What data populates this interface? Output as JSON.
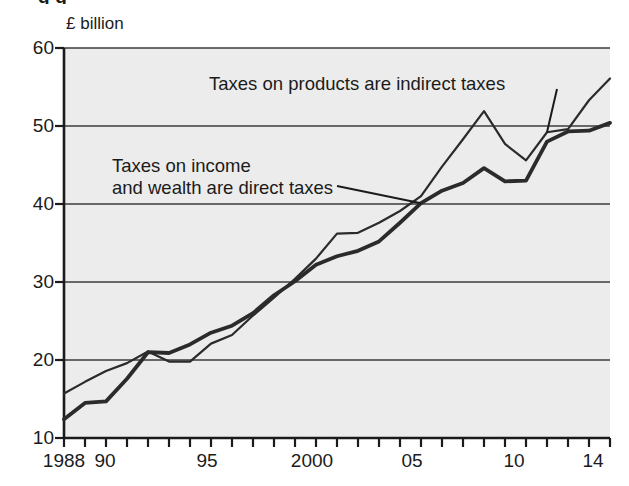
{
  "figure": {
    "cut_off_title": "g g",
    "background_color": "#ffffff",
    "plot_background_color": "#ececec",
    "axis_color": "#1b1b1b",
    "grid_color": "#3c3c3c"
  },
  "chart_data": {
    "type": "line",
    "title": "",
    "xlabel": "",
    "ylabel": "",
    "unit_label": "£ billion",
    "xlim": [
      1988,
      2014
    ],
    "ylim": [
      10,
      60
    ],
    "yticks": [
      10,
      20,
      30,
      40,
      50,
      60
    ],
    "ytick_labels": [
      "10",
      "20",
      "30",
      "40",
      "50",
      "60"
    ],
    "grid": "horizontal",
    "legend": "annotations",
    "x": [
      1988,
      1989,
      1990,
      1991,
      1992,
      1993,
      1994,
      1995,
      1996,
      1997,
      1998,
      1999,
      2000,
      2001,
      2002,
      2003,
      2004,
      2005,
      2006,
      2007,
      2008,
      2009,
      2010,
      2011,
      2012,
      2013,
      2014
    ],
    "xtick_values": [
      1988,
      1990,
      1995,
      2000,
      2005,
      2010,
      2014
    ],
    "xtick_labels": [
      "1988",
      "90",
      "95",
      "2000",
      "05",
      "10",
      "14"
    ],
    "series": [
      {
        "name": "Taxes on products are indirect taxes",
        "style": "thin",
        "color": "#2b2b2b",
        "width": 2.2,
        "values": [
          15.7,
          17.2,
          18.6,
          19.6,
          21.1,
          19.8,
          19.8,
          22.1,
          23.2,
          25.7,
          28.0,
          30.4,
          33.0,
          36.2,
          36.3,
          37.6,
          39.1,
          41.0,
          44.8,
          48.3,
          51.9,
          47.7,
          45.6,
          49.2,
          49.6,
          53.3,
          56.1
        ]
      },
      {
        "name": "Taxes on income and wealth are direct taxes",
        "style": "thick",
        "color": "#2b2b2b",
        "width": 3.8,
        "values": [
          12.4,
          14.5,
          14.7,
          17.6,
          21.0,
          20.9,
          22.0,
          23.5,
          24.4,
          26.0,
          28.3,
          30.1,
          32.2,
          33.3,
          34.0,
          35.2,
          37.6,
          40.1,
          41.7,
          42.7,
          44.6,
          42.9,
          43.0,
          48.0,
          49.3,
          49.4,
          50.4
        ]
      }
    ],
    "annotations": [
      {
        "id": "indirect",
        "text": "Taxes on products are indirect taxes",
        "lines": [
          "Taxes on products are indirect taxes"
        ],
        "target_year": 2011,
        "target_value": 49.2
      },
      {
        "id": "direct",
        "text": "Taxes on income and wealth are direct taxes",
        "lines": [
          "Taxes on income",
          "and wealth are direct taxes"
        ],
        "target_year": 2005,
        "target_value": 40.1
      }
    ]
  }
}
